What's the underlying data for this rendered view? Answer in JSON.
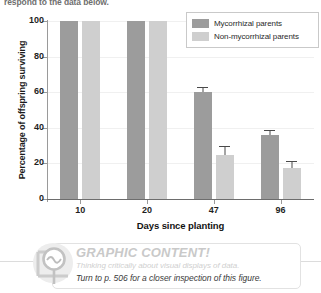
{
  "prompt": {
    "text": "respond to the data below."
  },
  "chart_data": {
    "type": "bar",
    "title": "",
    "xlabel": "Days since planting",
    "ylabel": "Percentage of offspring surviving",
    "categories": [
      "10",
      "20",
      "47",
      "96"
    ],
    "ylim": [
      0,
      100
    ],
    "yticks": [
      0,
      20,
      40,
      60,
      80,
      100
    ],
    "grid": true,
    "legend_position": "top-right",
    "series": [
      {
        "name": "Mycorrhizal parents",
        "color": "#9c9c9c",
        "values": [
          100,
          100,
          60,
          36
        ],
        "errors": [
          0,
          0,
          3,
          2.5
        ]
      },
      {
        "name": "Non-mycorrhizal parents",
        "color": "#cfcfcf",
        "values": [
          100,
          100,
          25,
          17.5
        ],
        "errors": [
          0,
          0,
          5,
          4
        ]
      }
    ]
  },
  "legend": {
    "items": [
      {
        "label": "Mycorrhizal parents",
        "color": "#9c9c9c"
      },
      {
        "label": "Non-mycorrhizal parents",
        "color": "#cfcfcf"
      }
    ]
  },
  "banner": {
    "title": "GRAPHIC CONTENT!",
    "subtitle": "Thinking critically about visual displays of data.",
    "cta": "Turn to p. 506 for a closer inspection of this figure.",
    "icon": "magnifier-chart-icon"
  }
}
